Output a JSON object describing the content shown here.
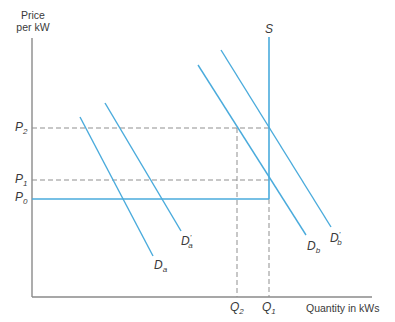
{
  "diagram": {
    "type": "supply-demand",
    "y_axis_title_line1": "Price",
    "y_axis_title_line2": "per kW",
    "x_axis_title": "Quantity in kWs",
    "price_labels": [
      {
        "base": "P",
        "sub": "2"
      },
      {
        "base": "P",
        "sub": "1"
      },
      {
        "base": "P",
        "sub": "0"
      }
    ],
    "quantity_labels": [
      {
        "base": "Q",
        "sub": "2"
      },
      {
        "base": "Q",
        "sub": "1"
      }
    ],
    "supply_label": "S",
    "demand_labels": [
      {
        "base": "D",
        "sub": "a",
        "prime": ""
      },
      {
        "base": "D",
        "sub": "a",
        "prime": "'"
      },
      {
        "base": "D",
        "sub": "b",
        "prime": ""
      },
      {
        "base": "D",
        "sub": "b",
        "prime": "'"
      }
    ],
    "colors": {
      "curve": "#4aabdc",
      "axis": "#8a8a8a",
      "dashed": "#8f8f8f",
      "text": "#3a3a3a"
    }
  }
}
